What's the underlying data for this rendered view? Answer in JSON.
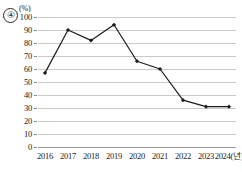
{
  "figure": {
    "option_marker": "④",
    "unit_label": "(%)"
  },
  "chart_data": {
    "type": "line",
    "title": "",
    "xlabel": "",
    "ylabel": "",
    "unit": "(%)",
    "x_axis_suffix": "(년)",
    "categories": [
      "2016",
      "2017",
      "2018",
      "2019",
      "2020",
      "2021",
      "2022",
      "2023",
      "2024"
    ],
    "tick_labels_x": [
      "2016",
      "2017",
      "2018",
      "2019",
      "2020",
      "2021",
      "2022",
      "2023",
      "2024(년)"
    ],
    "values": [
      57,
      90,
      82,
      94,
      66,
      60,
      36,
      31,
      31
    ],
    "ylim": [
      0,
      100
    ],
    "ytick_values": [
      0,
      10,
      20,
      30,
      40,
      50,
      60,
      70,
      80,
      90,
      100
    ],
    "tick_labels_y": [
      "0",
      "10",
      "20",
      "30",
      "40",
      "50",
      "60",
      "70",
      "80",
      "90",
      "100"
    ],
    "grid": true,
    "legend": false,
    "series_color": "#1a1a1a",
    "grid_color": "#c9c9c9",
    "marker": "diamond"
  }
}
